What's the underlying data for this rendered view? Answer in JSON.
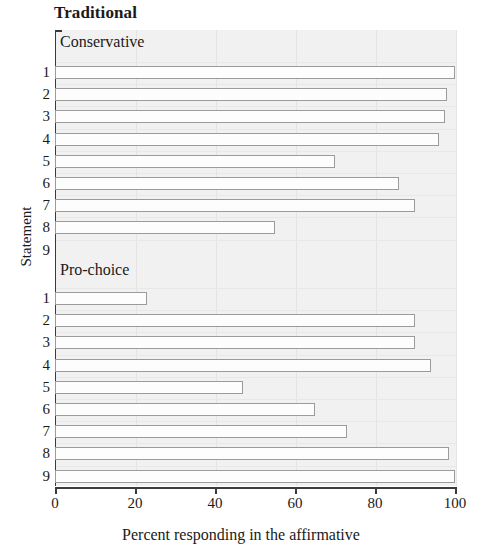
{
  "chart_data": {
    "type": "bar",
    "orientation": "horizontal",
    "title": "Traditional",
    "xlabel": "Percent responding in the affirmative",
    "ylabel": "Statement",
    "xlim": [
      0,
      100
    ],
    "xticks": [
      0,
      20,
      40,
      60,
      80,
      100
    ],
    "xtick_labels": [
      "0",
      "20",
      "40",
      "60",
      "80",
      "100"
    ],
    "categories": [
      "1",
      "2",
      "3",
      "4",
      "5",
      "6",
      "7",
      "8",
      "9"
    ],
    "grid": "vertical-faint",
    "legend": "none",
    "panel_layout": "stacked-trellis",
    "panels": [
      {
        "label": "Conservative",
        "categories": [
          "1",
          "2",
          "3",
          "4",
          "5",
          "6",
          "7",
          "8",
          "9"
        ],
        "values": [
          100,
          98,
          97.5,
          96,
          70,
          86,
          90,
          55,
          0
        ]
      },
      {
        "label": "Pro-choice",
        "categories": [
          "1",
          "2",
          "3",
          "4",
          "5",
          "6",
          "7",
          "8",
          "9"
        ],
        "values": [
          23,
          90,
          90,
          94,
          47,
          65,
          73,
          98.5,
          100
        ]
      }
    ],
    "colors": {
      "panel_background": "#f1f1f1",
      "bar_fill": "#fdfdfd",
      "bar_border": "#9b9b9b",
      "axis": "#3a3a3a",
      "gridline": "#e4e4e4",
      "text": "#1a1a1a"
    }
  }
}
